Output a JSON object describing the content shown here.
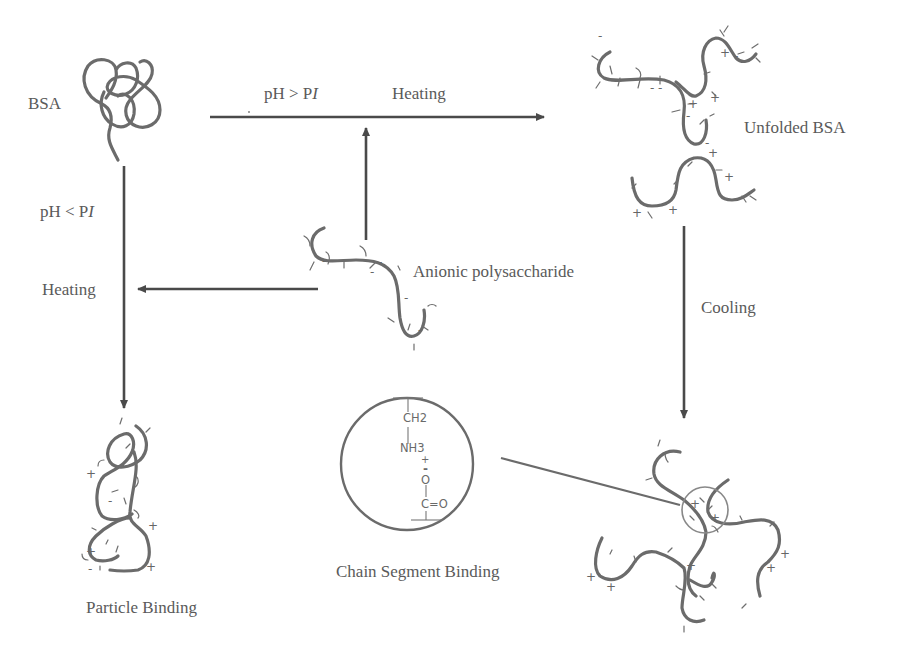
{
  "diagram": {
    "type": "process-flow",
    "labels": {
      "bsa": "BSA",
      "unfolded_bsa": "Unfolded BSA",
      "anionic_polysaccharide": "Anionic polysaccharide",
      "particle_binding": "Particle Binding",
      "chain_segment_binding": "Chain Segment Binding",
      "cooling": "Cooling",
      "heating_top": "Heating",
      "heating_left": "Heating",
      "ph_gt_pi_prefix": "pH > P",
      "ph_gt_pi_italic": "I",
      "ph_lt_pi_prefix": "pH < P",
      "ph_lt_pi_italic": "I"
    },
    "chemical_structure": {
      "line1": "CH2",
      "line2": "NH3",
      "charge_pos": "+",
      "charge_neg": "-",
      "line3": "O",
      "line4": "C=O"
    },
    "nodes": [
      {
        "id": "bsa",
        "label": "BSA"
      },
      {
        "id": "unfolded_bsa",
        "label": "Unfolded BSA"
      },
      {
        "id": "anionic_polysaccharide",
        "label": "Anionic polysaccharide"
      },
      {
        "id": "particle_binding",
        "label": "Particle Binding"
      },
      {
        "id": "chain_segment_binding",
        "label": "Chain Segment Binding"
      }
    ],
    "edges": [
      {
        "from": "bsa",
        "to": "unfolded_bsa",
        "label": "pH > PI, Heating"
      },
      {
        "from": "anionic_polysaccharide",
        "to": "bsa-unfolded-arrow",
        "label": ""
      },
      {
        "from": "anionic_polysaccharide",
        "to": "bsa-down-arrow",
        "label": "Heating"
      },
      {
        "from": "bsa",
        "to": "particle_binding",
        "label": "pH < PI"
      },
      {
        "from": "unfolded_bsa",
        "to": "chain_segment_complex",
        "label": "Cooling"
      }
    ],
    "colors": {
      "strand": "#6b6b6b",
      "arrow": "#4a4a4a",
      "text": "#5a5a5a"
    }
  }
}
